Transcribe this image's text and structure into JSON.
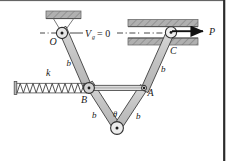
{
  "figure": {
    "type": "engineering-mechanism-diagram",
    "caption_labels": {
      "pivot_O": "O",
      "joint_A": "A",
      "joint_B": "B",
      "roller_C": "C",
      "force_P": "P",
      "spring_k": "k",
      "angle_theta": "θ",
      "datum": "V",
      "datum_sub": "g",
      "datum_eq": "= 0",
      "link_len_1": "b",
      "link_len_2": "b",
      "link_len_3": "b",
      "link_len_4": "b",
      "link_len_5": "b"
    },
    "colors": {
      "link_fill": "#c9c9c9",
      "link_stroke": "#3a3a3a",
      "hatch_block": "#a8a8a8",
      "hatch_stroke": "#6b6b6b",
      "pin_fill": "#e8e8e8",
      "line": "#222222",
      "border": "#3a3a3a",
      "background": "#ffffff"
    },
    "geometry": {
      "pivot_O": [
        62,
        33
      ],
      "roller_C": [
        171,
        33
      ],
      "joint_B": [
        89,
        88
      ],
      "joint_A": [
        144,
        88
      ],
      "bottom_pivot": [
        117,
        128
      ],
      "spring_left_x": 16,
      "spring_right_x": 87,
      "spring_y": 88,
      "force_arrow_start": [
        173,
        31
      ],
      "force_arrow_end": [
        206,
        31
      ],
      "datum_line_y": 33
    }
  }
}
